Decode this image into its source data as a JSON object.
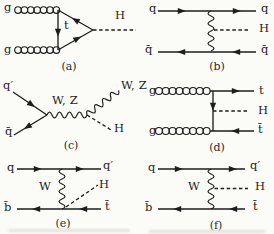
{
  "colors": {
    "ink": "#1d1d1d",
    "background": "#fbfbf8",
    "scan_artifact": "#cfcfc9"
  },
  "panels": {
    "a": {
      "caption": "(a)",
      "gluon_top": "g",
      "gluon_bottom": "g",
      "loop_quark": "t",
      "higgs": "H"
    },
    "b": {
      "caption": "(b)",
      "quark_in_top": "q",
      "quark_out_top": "q",
      "antiquark_in": "q̄",
      "antiquark_out": "q̄",
      "higgs": "H"
    },
    "c": {
      "caption": "(c)",
      "quark_in": "q′",
      "antiquark_in": "q̄",
      "boson_propagator": "W, Z",
      "boson_out": "W, Z",
      "higgs": "H"
    },
    "d": {
      "caption": "(d)",
      "gluon_top": "g",
      "gluon_bottom": "g",
      "top_out": "t",
      "antitop_out": "t̄",
      "higgs": "H"
    },
    "e": {
      "caption": "(e)",
      "quark_in": "q",
      "quark_out": "q′",
      "boson": "W",
      "antibottom_in": "b̄",
      "antitop_out": "t̄",
      "higgs": "H"
    },
    "f": {
      "caption": "(f)",
      "quark_in": "q",
      "quark_out": "q′",
      "boson": "W",
      "antibottom_in": "b̄",
      "antitop_out": "t̄",
      "higgs": "H"
    }
  }
}
